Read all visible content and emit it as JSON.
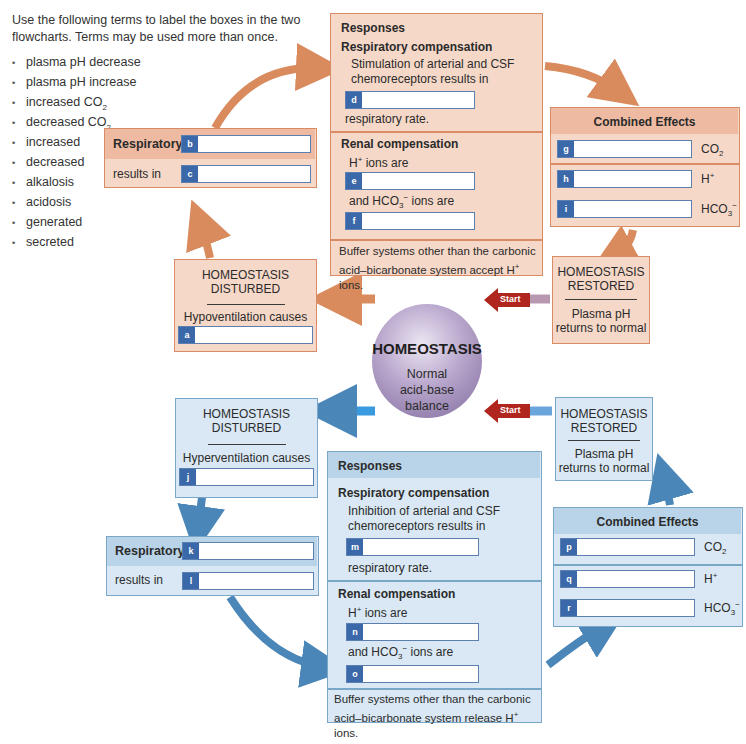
{
  "instructions": {
    "heading_partial": "...ing",
    "text": "Use the following terms to label the boxes in the two flowcharts. Terms may be used more than once."
  },
  "terms": [
    "plasma pH decrease",
    "plasma pH increase",
    "increased CO2",
    "decreased CO2",
    "increased",
    "decreased",
    "alkalosis",
    "acidosis",
    "generated",
    "secreted"
  ],
  "center": {
    "title": "HOMEOSTASIS",
    "subtitle": "Normal acid-base balance",
    "start_label": "Start"
  },
  "acidosis_flow": {
    "disturbed": {
      "title1": "HOMEOSTASIS",
      "title2": "DISTURBED",
      "cause": "Hypoventilation causes",
      "field": "a"
    },
    "respiratory": {
      "label1": "Respiratory",
      "field1": "b",
      "label2": "results in",
      "field2": "c"
    },
    "responses": {
      "title": "Responses",
      "resp_comp_title": "Respiratory compensation",
      "resp_text": "Stimulation of arterial and CSF chemoreceptors results in",
      "resp_field": "d",
      "resp_after": "respiratory rate.",
      "renal_title": "Renal compensation",
      "renal_h": "H+ ions are",
      "renal_field1": "e",
      "renal_hco3": "and HCO3− ions are",
      "renal_field2": "f",
      "buffer": "Buffer systems other than the carbonic acid–bicarbonate system accept H+ ions."
    },
    "combined": {
      "title": "Combined Effects",
      "rows": [
        {
          "field": "g",
          "label": "CO2"
        },
        {
          "field": "h",
          "label": "H+"
        },
        {
          "field": "i",
          "label": "HCO3−"
        }
      ]
    },
    "restored": {
      "title1": "HOMEOSTASIS",
      "title2": "RESTORED",
      "text": "Plasma pH returns to normal"
    }
  },
  "alkalosis_flow": {
    "disturbed": {
      "title1": "HOMEOSTASIS",
      "title2": "DISTURBED",
      "cause": "Hyperventilation causes",
      "field": "j"
    },
    "respiratory": {
      "label1": "Respiratory",
      "field1": "k",
      "label2": "results in",
      "field2": "l"
    },
    "responses": {
      "title": "Responses",
      "resp_comp_title": "Respiratory compensation",
      "resp_text": "Inhibition of arterial and CSF chemoreceptors results in",
      "resp_field": "m",
      "resp_after": "respiratory rate.",
      "renal_title": "Renal compensation",
      "renal_h": "H+ ions are",
      "renal_field1": "n",
      "renal_hco3": "and HCO3− ions are",
      "renal_field2": "o",
      "buffer": "Buffer systems other than the carbonic acid–bicarbonate system release H+ ions."
    },
    "combined": {
      "title": "Combined Effects",
      "rows": [
        {
          "field": "p",
          "label": "CO2"
        },
        {
          "field": "q",
          "label": "H+"
        },
        {
          "field": "r",
          "label": "HCO3−"
        }
      ]
    },
    "restored": {
      "title1": "HOMEOSTASIS",
      "title2": "RESTORED",
      "text": "Plasma pH returns to normal"
    }
  },
  "colors": {
    "acidosis_box": "#f6d8c8",
    "acidosis_border": "#d98b66",
    "acidosis_arrow": "#d98b5e",
    "alkalosis_box": "#d9e8f4",
    "alkalosis_border": "#7aa6c8",
    "alkalosis_arrow": "#4a86b8",
    "tag": "#3a68a8",
    "start": "#b0261e"
  }
}
